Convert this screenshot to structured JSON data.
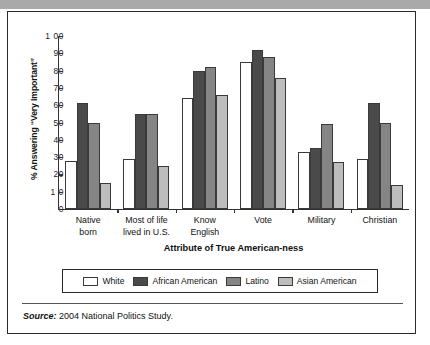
{
  "figure": {
    "source_prefix": "Source:",
    "source_text": "2004 National Politics Study."
  },
  "chart_data": {
    "type": "bar",
    "title": "",
    "xlabel": "Attribute of True American-ness",
    "ylabel": "% Answering “Very Important”",
    "ylim": [
      0,
      100
    ],
    "yticks": [
      0,
      10,
      20,
      30,
      40,
      50,
      60,
      70,
      80,
      90,
      100
    ],
    "ytick_labels": [
      "0",
      "1 0",
      "20",
      "30",
      "40",
      "50",
      "60",
      "70",
      "80",
      "90",
      "1 00"
    ],
    "grid": false,
    "legend_position": "bottom",
    "categories": [
      "Native born",
      "Most of life lived in U.S.",
      "Know English",
      "Vote",
      "Military",
      "Christian"
    ],
    "category_lines": [
      [
        "Native",
        "born"
      ],
      [
        "Most of life",
        "lived in U.S."
      ],
      [
        "Know",
        "English"
      ],
      [
        "Vote"
      ],
      [
        "Military"
      ],
      [
        "Christian"
      ]
    ],
    "series": [
      {
        "name": "White",
        "color": "#ffffff",
        "values": [
          28,
          29,
          64,
          85,
          33,
          29
        ]
      },
      {
        "name": "African American",
        "color": "#4a4a4a",
        "values": [
          61,
          55,
          80,
          92,
          35,
          61
        ]
      },
      {
        "name": "Latino",
        "color": "#858585",
        "values": [
          50,
          55,
          82,
          88,
          49,
          50
        ]
      },
      {
        "name": "Asian American",
        "color": "#bdbdbd",
        "values": [
          15,
          25,
          66,
          76,
          27,
          14
        ]
      }
    ]
  }
}
